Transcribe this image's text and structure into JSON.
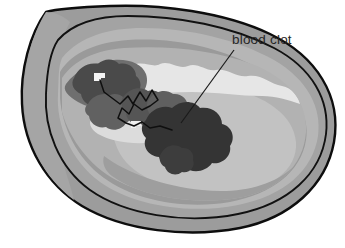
{
  "figure": {
    "background_color": "#ffffff",
    "width": 345,
    "height": 248
  },
  "annotations": [
    {
      "id": "blood-clot",
      "label": "blood clot",
      "text_x": 232,
      "text_y": 44,
      "leader_from_x": 234,
      "leader_from_y": 50,
      "leader_to_x": 181,
      "leader_to_y": 123,
      "leader_color": "#1a1a1a",
      "leader_width": 1.2
    }
  ],
  "anatomy": {
    "outline_color": "#0d0d0d",
    "outline_width": 2.2,
    "layers": [
      {
        "name": "outer-wall-adventitia",
        "color": "#9c9c9c"
      },
      {
        "name": "vessel-wall-media",
        "color": "#a8a8a8"
      },
      {
        "name": "wall-highlight-band",
        "color": "#c3c3c3"
      },
      {
        "name": "lumen-field",
        "color": "#b4b4b4"
      },
      {
        "name": "intima-lining",
        "color": "#d2d2d2"
      },
      {
        "name": "lumen-cavity-light",
        "color": "#e8e8e8"
      },
      {
        "name": "inner-shadow",
        "color": "#8e8e8e"
      }
    ],
    "clot": {
      "name": "blood-clot-mass",
      "primary_color": "#3a3a3a",
      "secondary_color": "#6e6e6e",
      "tertiary_color": "#565656",
      "highlight_color": "#f2f2f2",
      "fibrin_strand_color": "#111111",
      "fibrin_strand_width": 1.4
    }
  },
  "colors": {
    "white": "#ffffff",
    "black": "#0d0d0d",
    "text": "#262626"
  }
}
